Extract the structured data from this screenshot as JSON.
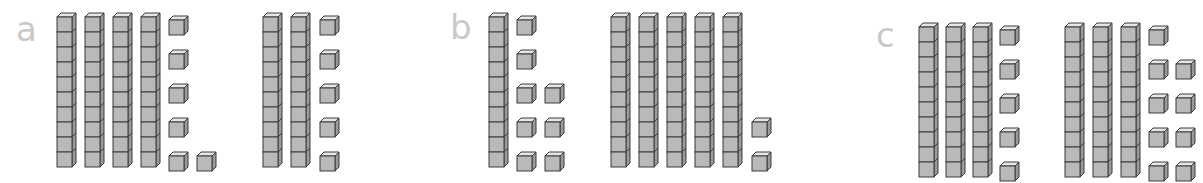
{
  "colors": {
    "front": "#b9b9b9",
    "top": "#e6e6e6",
    "side": "#9a9a9a",
    "stroke": "#3a3a3a",
    "label": "#c9c9c9"
  },
  "panels": [
    {
      "label": "a",
      "label_pos": [
        16,
        12
      ],
      "groups": [
        {
          "tens": 4,
          "ones": 6,
          "tens_x": 57,
          "tens_gap": 28,
          "ones_layout": [
            [
              169,
              16
            ],
            [
              169,
              50
            ],
            [
              169,
              84
            ],
            [
              169,
              118
            ],
            [
              169,
              152
            ],
            [
              197,
              152
            ]
          ]
        },
        {
          "tens": 2,
          "ones": 5,
          "tens_x": 263,
          "tens_gap": 28,
          "ones_layout": [
            [
              320,
              16
            ],
            [
              320,
              50
            ],
            [
              320,
              84
            ],
            [
              320,
              118
            ],
            [
              320,
              152
            ]
          ]
        }
      ]
    },
    {
      "label": "b",
      "label_pos": [
        450,
        10
      ],
      "groups": [
        {
          "tens": 1,
          "ones": 8,
          "tens_x": 489,
          "tens_gap": 28,
          "ones_layout": [
            [
              517,
              16
            ],
            [
              517,
              50
            ],
            [
              517,
              84
            ],
            [
              545,
              84
            ],
            [
              517,
              118
            ],
            [
              545,
              118
            ],
            [
              517,
              152
            ],
            [
              545,
              152
            ]
          ]
        },
        {
          "tens": 5,
          "ones": 2,
          "tens_x": 611,
          "tens_gap": 28,
          "ones_layout": [
            [
              752,
              118
            ],
            [
              752,
              152
            ]
          ]
        }
      ]
    },
    {
      "label": "c",
      "label_pos": [
        876,
        18
      ],
      "groups": [
        {
          "tens": 3,
          "ones": 5,
          "tens_x": 919,
          "tens_gap": 27,
          "ones_layout": [
            [
              1000,
              26
            ],
            [
              1000,
              60
            ],
            [
              1000,
              94
            ],
            [
              1000,
              128
            ],
            [
              1000,
              162
            ]
          ]
        },
        {
          "tens": 3,
          "ones": 9,
          "tens_x": 1065,
          "tens_gap": 28,
          "ones_layout": [
            [
              1149,
              26
            ],
            [
              1149,
              60
            ],
            [
              1176,
              60
            ],
            [
              1149,
              94
            ],
            [
              1176,
              94
            ],
            [
              1149,
              128
            ],
            [
              1176,
              128
            ],
            [
              1149,
              162
            ],
            [
              1176,
              162
            ]
          ]
        }
      ]
    }
  ],
  "geometry": {
    "cube": 15,
    "depth": 4,
    "rod_top_a": 13,
    "rod_top_b": 13,
    "rod_top_c": 23
  }
}
